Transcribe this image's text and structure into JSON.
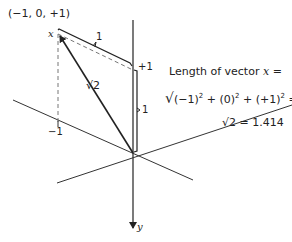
{
  "diagram": {
    "point_label": "(−1, 0, +1)",
    "vector_name": "x",
    "axis_y_label": "y",
    "tick_plus1": "+1",
    "tick_minus1": "−1",
    "bracket_top_label": "1",
    "bracket_right_label": "1",
    "diagonal_label": "√2",
    "equation": {
      "line1": "Length of vector",
      "line1_var": "x",
      "line1_eq": "=",
      "line2_radical": "√",
      "line2_terms": [
        "(−1)",
        "2",
        " + (0)",
        "2",
        " + (+1)",
        "2"
      ],
      "line2_eq": "=",
      "line3": "√2 = 1.414"
    }
  }
}
